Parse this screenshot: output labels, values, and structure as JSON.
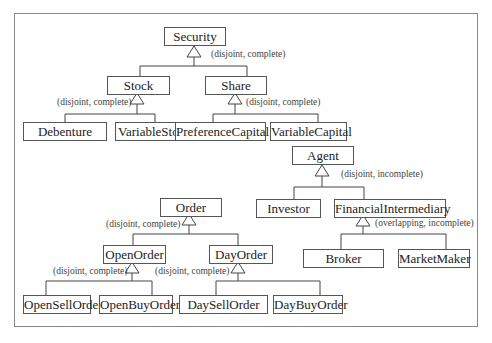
{
  "diagram": {
    "type": "class-hierarchy",
    "nodes": {
      "security": "Security",
      "stock": "Stock",
      "share": "Share",
      "debenture": "Debenture",
      "variable_stock": "VariableStock",
      "preference_capital": "PreferenceCapital",
      "variable_capital": "VariableCapital",
      "agent": "Agent",
      "investor": "Investor",
      "financial_intermediary": "FinancialIntermediary",
      "broker": "Broker",
      "market_maker": "MarketMaker",
      "order": "Order",
      "open_order": "OpenOrder",
      "day_order": "DayOrder",
      "open_sell_order": "OpenSellOrder",
      "open_buy_order": "OpenBuyOrder",
      "day_sell_order": "DaySellOrder",
      "day_buy_order": "DayBuyOrder"
    },
    "constraints": {
      "security": "(disjoint, complete)",
      "stock": "(disjoint, complete)",
      "share": "(disjoint, complete)",
      "agent": "(disjoint, incomplete)",
      "financial_intermediary": "(overlapping, incomplete)",
      "order": "(disjoint, complete)",
      "open_order": "(disjoint, complete)",
      "day_order": "(disjoint, complete)"
    },
    "edges": [
      {
        "parent": "Security",
        "children": [
          "Stock",
          "Share"
        ]
      },
      {
        "parent": "Stock",
        "children": [
          "Debenture",
          "VariableStock"
        ]
      },
      {
        "parent": "Share",
        "children": [
          "PreferenceCapital",
          "VariableCapital"
        ]
      },
      {
        "parent": "Agent",
        "children": [
          "Investor",
          "FinancialIntermediary"
        ]
      },
      {
        "parent": "FinancialIntermediary",
        "children": [
          "Broker",
          "MarketMaker"
        ]
      },
      {
        "parent": "Order",
        "children": [
          "OpenOrder",
          "DayOrder"
        ]
      },
      {
        "parent": "OpenOrder",
        "children": [
          "OpenSellOrder",
          "OpenBuyOrder"
        ]
      },
      {
        "parent": "DayOrder",
        "children": [
          "DaySellOrder",
          "DayBuyOrder"
        ]
      }
    ]
  }
}
